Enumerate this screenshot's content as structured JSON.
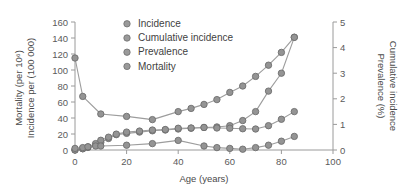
{
  "chart_data": {
    "type": "line",
    "title": "",
    "xlabel": "Age (years)",
    "ylabel_left_line1": "Mortality (per 10⁶)",
    "ylabel_left_line2": "Incidence per (100 000)",
    "ylabel_right_line1": "Cumulative incidence",
    "ylabel_right_line2": "Prevalence (%)",
    "xlim": [
      0,
      100
    ],
    "xticks": [
      0,
      20,
      40,
      60,
      80,
      100
    ],
    "xtick_labels": [
      "0",
      "20",
      "40",
      "60",
      "80",
      "100"
    ],
    "ylim_left": [
      0,
      160
    ],
    "yticks_left": [
      0,
      20,
      40,
      60,
      80,
      100,
      120,
      140,
      160
    ],
    "ytick_labels_left": [
      "0",
      "20",
      "40",
      "60",
      "80",
      "100",
      "120",
      "140",
      "160"
    ],
    "ylim_right": [
      0,
      5
    ],
    "yticks_right": [
      0,
      1,
      2,
      3,
      4,
      5
    ],
    "ytick_labels_right": [
      "0",
      "1",
      "2",
      "3",
      "4",
      "5"
    ],
    "grid": false,
    "legend_position": "top-center",
    "marker": "circle",
    "series_color": "#949494",
    "line_color": "#9d9d9d",
    "axis_color": "#9a9a9a",
    "series": [
      {
        "name": "Incidence",
        "axis": "left",
        "x": [
          0,
          3,
          10,
          20,
          30,
          40,
          45,
          50,
          55,
          60,
          65,
          70,
          75,
          80,
          85
        ],
        "y": [
          115,
          67,
          45,
          42,
          38,
          48,
          52,
          57,
          63,
          72,
          80,
          92,
          106,
          122,
          141
        ]
      },
      {
        "name": "Cumulative incidence",
        "axis": "right",
        "x": [
          0,
          3,
          5,
          8,
          10,
          13,
          16,
          20,
          25,
          30,
          35,
          40,
          45,
          50,
          55,
          60,
          65,
          70,
          75,
          80,
          85
        ],
        "y": [
          0.0,
          0.05,
          0.1,
          0.2,
          0.3,
          0.45,
          0.6,
          0.65,
          0.7,
          0.75,
          0.78,
          0.82,
          0.85,
          0.88,
          0.9,
          0.95,
          1.15,
          1.5,
          2.3,
          3.0,
          4.4
        ]
      },
      {
        "name": "Prevalence",
        "axis": "right",
        "x": [
          0,
          3,
          5,
          8,
          10,
          13,
          16,
          20,
          25,
          30,
          35,
          40,
          45,
          50,
          55,
          60,
          65,
          70,
          75,
          80,
          85
        ],
        "y": [
          0.0,
          0.05,
          0.12,
          0.25,
          0.38,
          0.5,
          0.62,
          0.7,
          0.74,
          0.78,
          0.8,
          0.85,
          0.86,
          0.88,
          0.86,
          0.85,
          0.83,
          0.82,
          0.95,
          1.2,
          1.5
        ]
      },
      {
        "name": "Mortality",
        "axis": "left",
        "x": [
          0,
          3,
          5,
          8,
          10,
          20,
          30,
          40,
          50,
          55,
          60,
          65,
          70,
          75,
          80,
          85
        ],
        "y": [
          2,
          3,
          4,
          5,
          5,
          6,
          8,
          12,
          5,
          3,
          2,
          1,
          3,
          6,
          11,
          17
        ]
      }
    ],
    "legend": [
      {
        "label": "Incidence"
      },
      {
        "label": "Cumulative incidence"
      },
      {
        "label": "Prevalence"
      },
      {
        "label": "Mortality"
      }
    ]
  }
}
